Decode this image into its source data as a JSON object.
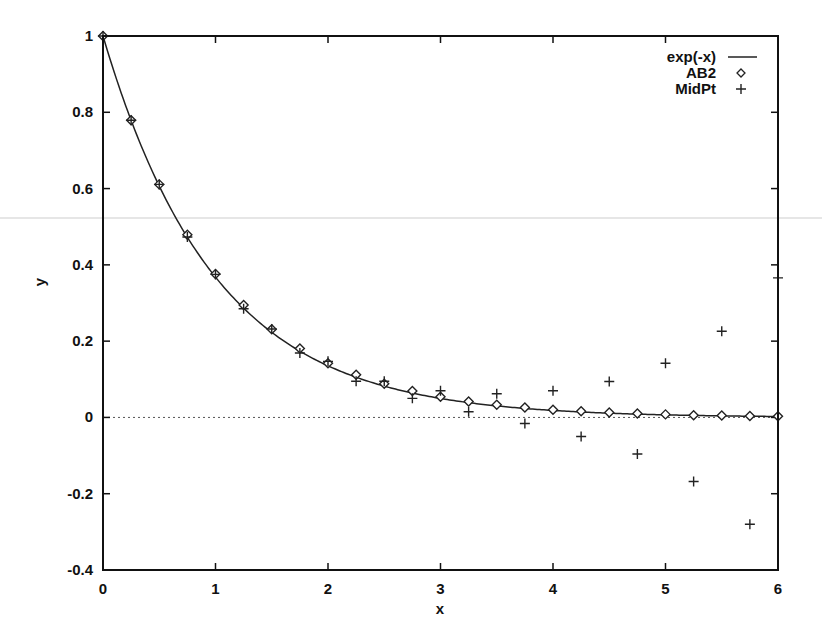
{
  "chart_data": {
    "type": "line",
    "title": "",
    "xlabel": "x",
    "ylabel": "y",
    "xlim": [
      0,
      6
    ],
    "ylim": [
      -0.4,
      1
    ],
    "xticks": [
      0,
      1,
      2,
      3,
      4,
      5,
      6
    ],
    "xtick_labels": [
      "0",
      "1",
      "2",
      "3",
      "4",
      "5",
      "6"
    ],
    "yticks": [
      -0.4,
      -0.2,
      0,
      0.2,
      0.4,
      0.6,
      0.8,
      1
    ],
    "ytick_labels": [
      "-0.4",
      "-0.2",
      "0",
      "0.2",
      "0.4",
      "0.6",
      "0.8",
      "1"
    ],
    "grid": false,
    "zero_line": "dotted",
    "legend_position": "top-right",
    "series": [
      {
        "name": "exp(-x)",
        "style": "solid-line",
        "function": "exp(-x)"
      },
      {
        "name": "AB2",
        "style": "diamond-markers",
        "x": [
          0,
          0.25,
          0.5,
          0.75,
          1,
          1.25,
          1.5,
          1.75,
          2,
          2.25,
          2.5,
          2.75,
          3,
          3.25,
          3.5,
          3.75,
          4,
          4.25,
          4.5,
          4.75,
          5,
          5.25,
          5.5,
          5.75,
          6
        ],
        "values": [
          1,
          0.779,
          0.611,
          0.479,
          0.376,
          0.295,
          0.231,
          0.181,
          0.142,
          0.112,
          0.088,
          0.069,
          0.054,
          0.042,
          0.033,
          0.026,
          0.02,
          0.016,
          0.013,
          0.01,
          0.008,
          0.006,
          0.005,
          0.004,
          0.003
        ]
      },
      {
        "name": "MidPt",
        "style": "plus-markers",
        "x": [
          0,
          0.25,
          0.5,
          0.75,
          1,
          1.25,
          1.5,
          1.75,
          2,
          2.25,
          2.5,
          2.75,
          3,
          3.25,
          3.5,
          3.75,
          4,
          4.25,
          4.5,
          4.75,
          5,
          5.25,
          5.5,
          5.75,
          6
        ],
        "values": [
          1,
          0.779,
          0.611,
          0.473,
          0.375,
          0.285,
          0.232,
          0.169,
          0.147,
          0.095,
          0.095,
          0.05,
          0.07,
          0.015,
          0.062,
          -0.016,
          0.07,
          -0.05,
          0.094,
          -0.096,
          0.142,
          -0.168,
          0.226,
          -0.28,
          0.366
        ]
      }
    ]
  }
}
